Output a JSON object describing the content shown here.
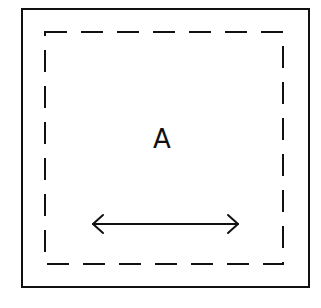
{
  "diagram": {
    "outer_box": {
      "x": 22,
      "y": 9,
      "width": 287,
      "height": 278,
      "stroke": "#111111",
      "stroke_width": 2
    },
    "inner_box": {
      "x": 45,
      "y": 32,
      "width": 238,
      "height": 232,
      "stroke": "#111111",
      "stroke_width": 2,
      "dash": "22 14",
      "style": "dashed"
    },
    "label": {
      "text": "A",
      "x": 162,
      "y": 148
    },
    "arrow": {
      "type": "double-headed",
      "x1": 92,
      "y1": 224,
      "x2": 238,
      "y2": 224,
      "stroke": "#111111"
    }
  }
}
